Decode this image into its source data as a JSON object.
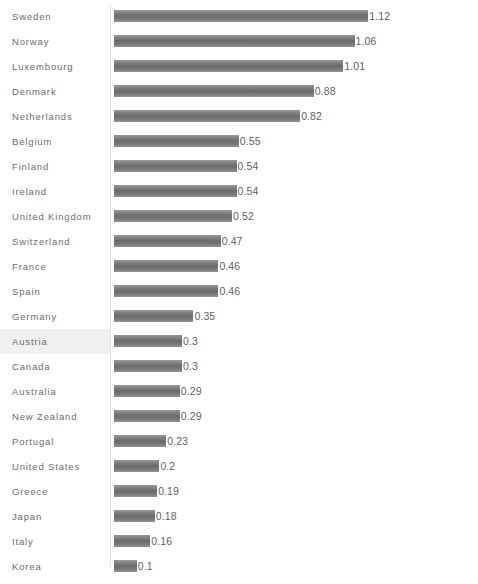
{
  "chart_data": {
    "type": "bar",
    "orientation": "horizontal",
    "title": "",
    "subtitle": "",
    "xlabel": "",
    "ylabel": "",
    "grid": false,
    "legend": null,
    "xlim": [
      0,
      1.2
    ],
    "categories": [
      "Sweden",
      "Norway",
      "Luxembourg",
      "Denmark",
      "Netherlands",
      "Belgium",
      "Finland",
      "Ireland",
      "United Kingdom",
      "Switzerland",
      "France",
      "Spain",
      "Germany",
      "Austria",
      "Canada",
      "Australia",
      "New Zealand",
      "Portugal",
      "United States",
      "Greece",
      "Japan",
      "Italy",
      "Korea"
    ],
    "values": [
      1.12,
      1.06,
      1.01,
      0.88,
      0.82,
      0.55,
      0.54,
      0.54,
      0.52,
      0.47,
      0.46,
      0.46,
      0.35,
      0.3,
      0.3,
      0.29,
      0.29,
      0.23,
      0.2,
      0.19,
      0.18,
      0.16,
      0.1
    ],
    "value_labels": [
      "1.12",
      "1.06",
      "1.01",
      "0.88",
      "0.82",
      "0.55",
      "0.54",
      "0.54",
      "0.52",
      "0.47",
      "0.46",
      "0.46",
      "0.35",
      "0.3",
      "0.3",
      "0.29",
      "0.29",
      "0.23",
      "0.2",
      "0.19",
      "0.18",
      "0.16",
      "0.1"
    ],
    "highlighted_category": "Austria",
    "bar_color": "#6a6a6a",
    "highlight_color": "#f0f0f0",
    "label_color": "#6b6b6b",
    "value_color": "#5f5f5f"
  },
  "caption": {
    "text": ""
  }
}
